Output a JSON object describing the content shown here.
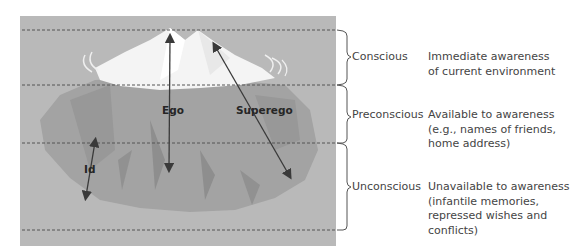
{
  "diagram": {
    "structures": [
      {
        "name": "Ego"
      },
      {
        "name": "Superego"
      },
      {
        "name": "Id"
      }
    ],
    "levels": [
      {
        "name": "Conscious",
        "description": "Immediate awareness\nof current environment"
      },
      {
        "name": "Preconscious",
        "description": "Available to awareness\n(e.g., names of friends,\nhome address)"
      },
      {
        "name": "Unconscious",
        "description": "Unavailable to awareness\n(infantile memories,\nrepressed wishes and\nconflicts)"
      }
    ],
    "colors": {
      "background_water": "#b9b9b9",
      "iceberg_tip": "#f4f4f4",
      "iceberg_body": "#a3a3a3",
      "arrow": "#3a3a3a",
      "dashed_line": "#555555",
      "text": "#444444"
    }
  }
}
